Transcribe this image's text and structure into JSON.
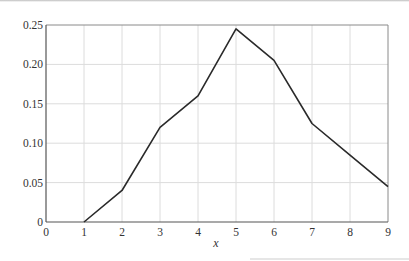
{
  "chart_data": {
    "type": "line",
    "title": "",
    "xlabel": "x",
    "ylabel": "",
    "x": [
      1,
      2,
      3,
      4,
      5,
      6,
      7,
      8,
      9
    ],
    "series": [
      {
        "name": "",
        "values": [
          0.0,
          0.04,
          0.12,
          0.16,
          0.245,
          0.205,
          0.125,
          0.085,
          0.045
        ]
      }
    ],
    "xlim": [
      0,
      9
    ],
    "ylim": [
      0,
      0.25
    ],
    "xticks": [
      "0",
      "1",
      "2",
      "3",
      "4",
      "5",
      "6",
      "7",
      "8",
      "9"
    ],
    "yticks": [
      "0",
      "0.05",
      "0.10",
      "0.15",
      "0.20",
      "0.25"
    ],
    "grid": true,
    "legend": null,
    "colors": {
      "line": "#2a2a2a",
      "grid": "#dcdcdc",
      "axis": "#555555"
    }
  }
}
